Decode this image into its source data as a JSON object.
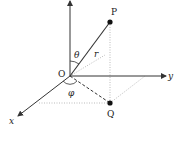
{
  "diagram": {
    "labels": {
      "origin": "O",
      "point_p": "P",
      "point_q": "Q",
      "radius": "r",
      "theta": "θ",
      "phi": "φ",
      "axis_x": "x",
      "axis_y": "y"
    },
    "colors": {
      "line": "#333333",
      "dotted": "#aaaaaa",
      "background": "#ffffff"
    }
  }
}
